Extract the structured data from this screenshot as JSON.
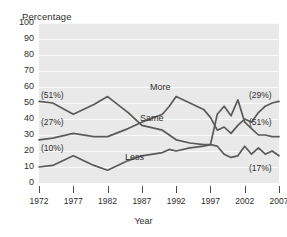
{
  "chart_data": {
    "type": "line",
    "title": "",
    "xlabel": "Year",
    "ylabel": "Percentage",
    "xlim": [
      1972,
      2007
    ],
    "ylim": [
      0,
      100
    ],
    "grid": true,
    "legend_position": "inline-annotations",
    "ytick_labels": [
      "100",
      "90",
      "80",
      "70",
      "60",
      "50",
      "40",
      "30",
      "20",
      "10",
      "0"
    ],
    "ytick_values": [
      100,
      90,
      80,
      70,
      60,
      50,
      40,
      30,
      20,
      10,
      0
    ],
    "xtick_labels": [
      "1972",
      "1977",
      "1982",
      "1987",
      "1992",
      "1997",
      "2002",
      "2007"
    ],
    "xtick_values": [
      1972,
      1977,
      1982,
      1987,
      1992,
      1997,
      2002,
      2007
    ],
    "series": [
      {
        "name": "More",
        "label": "More",
        "start_label": "(51%)",
        "end_label": "(51%)",
        "x": [
          1972,
          1974,
          1977,
          1980,
          1982,
          1985,
          1987,
          1990,
          1991,
          1992,
          1994,
          1996,
          1997,
          1998,
          1999,
          2000,
          2001,
          2002,
          2003,
          2004,
          2005,
          2006,
          2007
        ],
        "values": [
          51,
          50,
          43,
          49,
          54,
          44,
          36,
          33,
          30,
          27,
          25,
          24,
          24,
          43,
          48,
          42,
          52,
          38,
          34,
          30,
          30,
          29,
          29
        ]
      },
      {
        "name": "Same",
        "label": "Same",
        "start_label": "(27%)",
        "end_label": "(29%)",
        "x": [
          1972,
          1974,
          1977,
          1980,
          1982,
          1985,
          1987,
          1990,
          1991,
          1992,
          1994,
          1996,
          1997,
          1998,
          1999,
          2000,
          2001,
          2002,
          2003,
          2004,
          2005,
          2006,
          2007
        ],
        "values": [
          27,
          28,
          31,
          29,
          29,
          34,
          38,
          43,
          48,
          54,
          50,
          46,
          41,
          33,
          35,
          31,
          36,
          40,
          38,
          44,
          48,
          50,
          51
        ]
      },
      {
        "name": "Less",
        "label": "Less",
        "start_label": "(10%)",
        "end_label": "(17%)",
        "x": [
          1972,
          1974,
          1977,
          1980,
          1982,
          1985,
          1987,
          1990,
          1991,
          1992,
          1994,
          1996,
          1997,
          1998,
          1999,
          2000,
          2001,
          2002,
          2003,
          2004,
          2005,
          2006,
          2007
        ],
        "values": [
          10,
          11,
          17,
          11,
          8,
          14,
          17,
          19,
          21,
          20,
          22,
          23,
          24,
          23,
          18,
          16,
          17,
          23,
          18,
          22,
          18,
          20,
          17
        ]
      }
    ],
    "annotations": [
      {
        "text": "(51%)",
        "series": "More",
        "side": "left"
      },
      {
        "text": "(27%)",
        "series": "Same",
        "side": "left"
      },
      {
        "text": "(10%)",
        "series": "Less",
        "side": "left"
      },
      {
        "text": "(51%)",
        "series": "Same",
        "side": "right"
      },
      {
        "text": "(29%)",
        "series": "More",
        "side": "right"
      },
      {
        "text": "(17%)",
        "series": "Less",
        "side": "right"
      }
    ],
    "colors": {
      "line": "#5a5a5a",
      "plot_background": "#e9e9e9",
      "gridline": "#fafafa",
      "text": "#2e2e2e"
    }
  }
}
